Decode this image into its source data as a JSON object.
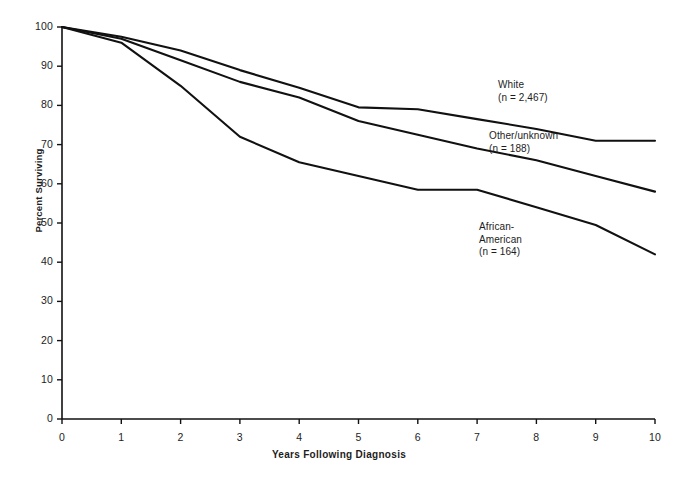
{
  "figure": {
    "background": "#ffffff",
    "line_color": "#111111"
  },
  "axes": {
    "x": {
      "label": "Years Following Diagnosis",
      "ticks": [
        "0",
        "1",
        "2",
        "3",
        "4",
        "5",
        "6",
        "7",
        "8",
        "9",
        "10"
      ],
      "min": 0,
      "max": 10
    },
    "y": {
      "label": "Percent Surviving",
      "ticks": [
        "0",
        "10",
        "20",
        "30",
        "40",
        "50",
        "60",
        "70",
        "80",
        "90",
        "100"
      ],
      "min": 0,
      "max": 100
    }
  },
  "annotations": [
    {
      "id": "white",
      "line1": "White",
      "line2": "(n = 2,467)",
      "line3": ""
    },
    {
      "id": "other",
      "line1": "Other/unknown",
      "line2": "(n = 188)",
      "line3": ""
    },
    {
      "id": "aa",
      "line1": "African-",
      "line2": "American",
      "line3": "(n = 164)"
    }
  ],
  "chart_data": {
    "type": "line",
    "title": "",
    "xlabel": "Years Following Diagnosis",
    "ylabel": "Percent Surviving",
    "xlim": [
      0,
      10
    ],
    "ylim": [
      0,
      100
    ],
    "grid": false,
    "legend": "inline-annotations",
    "x": [
      0,
      1,
      2,
      3,
      4,
      5,
      6,
      7,
      8,
      9,
      10
    ],
    "series": [
      {
        "name": "White",
        "n": 2467,
        "label": "White (n = 2,467)",
        "values": [
          100,
          97.5,
          94,
          89,
          84.5,
          79.5,
          79,
          76.5,
          74,
          71,
          71
        ]
      },
      {
        "name": "Other/unknown",
        "n": 188,
        "label": "Other/unknown (n = 188)",
        "values": [
          100,
          97,
          91.5,
          86,
          82,
          76,
          72.5,
          69,
          66,
          62,
          58
        ]
      },
      {
        "name": "African-American",
        "n": 164,
        "label": "African-American (n = 164)",
        "values": [
          100,
          96,
          85,
          72,
          65.5,
          62,
          58.5,
          58.5,
          54,
          49.5,
          42
        ]
      }
    ]
  }
}
